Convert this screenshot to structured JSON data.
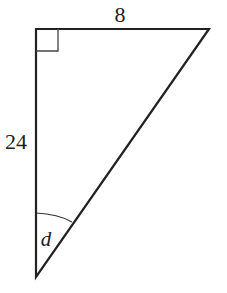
{
  "diagram": {
    "type": "right-triangle",
    "labels": {
      "top_side": "8",
      "left_side": "24",
      "angle": "d"
    },
    "right_angle_marker": true,
    "colors": {
      "stroke": "#222222",
      "background": "#ffffff"
    }
  }
}
